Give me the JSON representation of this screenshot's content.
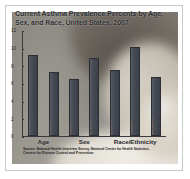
{
  "figure": {
    "title": "Current Asthma Prevalence Percents by Age, Sex, and Race, United States, 2007",
    "source_note": "Source: National Health Interview Survey, National Center for Health Statistics, Centers for Disease Control and Prevention",
    "colors": {
      "bar_fill": "#474b53",
      "axis": "#3a3a3c",
      "title_text": "#2e2e30",
      "bar_label_text": "#ecebe8"
    }
  },
  "chart_data": {
    "type": "bar",
    "title": "Current Asthma Prevalence Percents by Age, Sex, and Race, United States, 2007",
    "xlabel": "",
    "ylabel": "",
    "ylim": [
      0,
      12
    ],
    "yticks": [
      0,
      2,
      4,
      6,
      8,
      10,
      12
    ],
    "ytick_labels": [
      "0",
      "2",
      "4",
      "6",
      "8",
      "10",
      "12"
    ],
    "grid": false,
    "legend": "none",
    "categories": [
      "Child",
      "Adult",
      "Male",
      "Female",
      "White",
      "Black",
      "Hispanic"
    ],
    "values": [
      9.3,
      7.3,
      6.5,
      8.9,
      7.6,
      10.2,
      6.8
    ],
    "bar_labels": [
      "Child 9.3%",
      "Adult 7.3%",
      "Male 6.5%",
      "Female 8.9%",
      "White 7.6%",
      "Black 10.2%",
      "Hispanic 6.8%"
    ],
    "groups": [
      {
        "label": "Age",
        "categories": [
          "Child",
          "Adult"
        ]
      },
      {
        "label": "Sex",
        "categories": [
          "Male",
          "Female"
        ]
      },
      {
        "label": "Race/Ethnicity",
        "categories": [
          "White",
          "Black",
          "Hispanic"
        ]
      }
    ]
  }
}
